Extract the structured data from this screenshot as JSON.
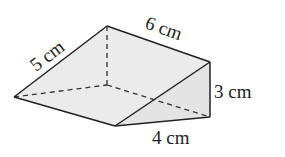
{
  "diagram": {
    "type": "triangular-prism",
    "labels": {
      "slant_edge": "5 cm",
      "length": "6 cm",
      "height": "3 cm",
      "base": "4 cm"
    },
    "colors": {
      "fill": "#ebebeb",
      "stroke": "#222222"
    }
  }
}
